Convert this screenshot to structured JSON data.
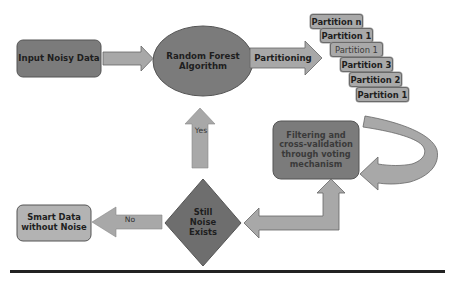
{
  "diagram": {
    "type": "flowchart",
    "colors": {
      "dark_node": "#7b7b7b",
      "light_node": "#b3b3b3",
      "arrow_fill": "#a8a8a8",
      "border": "#555555",
      "baseline": "#222222"
    },
    "nodes": {
      "input": {
        "label": "Input Noisy Data",
        "shape": "rounded-rect"
      },
      "algorithm": {
        "label": "Random Forest Algorithm",
        "line1": "Random Forest",
        "line2": "Algorithm",
        "shape": "ellipse"
      },
      "partitioning": {
        "label": "Partitioning",
        "shape": "block-arrow"
      },
      "partitions": [
        {
          "label": "Partition n"
        },
        {
          "label": "Partition 1"
        },
        {
          "label": "Partition 1"
        },
        {
          "label": "Partition 3"
        },
        {
          "label": "Partition 2"
        },
        {
          "label": "Partition 1"
        }
      ],
      "filtering": {
        "label": "Filtering and cross-validation through voting mechanism",
        "line1": "Filtering and",
        "line2": "cross-validation",
        "line3": "through voting",
        "line4": "mechanism",
        "shape": "rounded-rect"
      },
      "decision": {
        "label": "Still Noise Exists",
        "line1": "Still",
        "line2": "Noise",
        "line3": "Exists",
        "shape": "diamond"
      },
      "output": {
        "label": "Smart Data without Noise",
        "line1": "Smart Data",
        "line2": "without Noise",
        "shape": "rounded-rect"
      }
    },
    "edges": [
      {
        "from": "input",
        "to": "algorithm",
        "label": ""
      },
      {
        "from": "algorithm",
        "to": "partitions",
        "label": "Partitioning"
      },
      {
        "from": "filtering",
        "to": "filtering",
        "label": "",
        "kind": "loop"
      },
      {
        "from": "filtering",
        "to": "decision",
        "label": "",
        "kind": "bidirectional-elbow"
      },
      {
        "from": "decision",
        "to": "algorithm",
        "label": "Yes"
      },
      {
        "from": "decision",
        "to": "output",
        "label": "No"
      }
    ]
  }
}
